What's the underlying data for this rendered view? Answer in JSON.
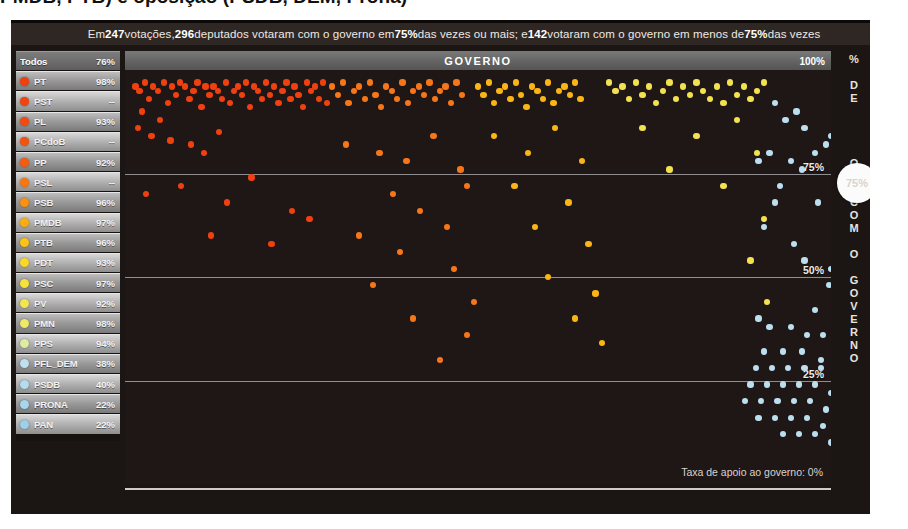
{
  "headline": "PMDB, PTB) e oposição (PSDB, DEM, Prona)",
  "banner": {
    "prefix": "Em ",
    "votacoes_count": "247",
    "mid1": " votações, ",
    "deputados_high": "296",
    "mid2": " deputados votaram com o governo em ",
    "threshold1": "75%",
    "mid3": " das vezes ou mais; e ",
    "deputados_low": "142",
    "mid4": " votaram com o governo em menos de ",
    "threshold2": "75%",
    "suffix": " das vezes"
  },
  "sidebar": {
    "rows": [
      {
        "name": "Todos",
        "pct": "76%",
        "color": "none",
        "all": true
      },
      {
        "name": "PT",
        "pct": "98%",
        "color": "#f04010"
      },
      {
        "name": "PST",
        "pct": "--",
        "color": "#f2440f"
      },
      {
        "name": "PL",
        "pct": "93%",
        "color": "#f24a10"
      },
      {
        "name": "PCdoB",
        "pct": "--",
        "color": "#f4520f"
      },
      {
        "name": "PP",
        "pct": "92%",
        "color": "#f55c10"
      },
      {
        "name": "PSL",
        "pct": "--",
        "color": "#f8760f"
      },
      {
        "name": "PSB",
        "pct": "96%",
        "color": "#fa9210"
      },
      {
        "name": "PMDB",
        "pct": "97%",
        "color": "#fcae10"
      },
      {
        "name": "PTB",
        "pct": "96%",
        "color": "#fdc414"
      },
      {
        "name": "PDT",
        "pct": "93%",
        "color": "#fad828"
      },
      {
        "name": "PSC",
        "pct": "97%",
        "color": "#f7e23a"
      },
      {
        "name": "PV",
        "pct": "92%",
        "color": "#f3e64c"
      },
      {
        "name": "PMN",
        "pct": "98%",
        "color": "#eeea66"
      },
      {
        "name": "PPS",
        "pct": "94%",
        "color": "#dfeba0"
      },
      {
        "name": "PFL_DEM",
        "pct": "38%",
        "color": "#bfe0ef"
      },
      {
        "name": "PSDB",
        "pct": "40%",
        "color": "#b4dcee"
      },
      {
        "name": "PRONA",
        "pct": "22%",
        "color": "#a8d6ec"
      },
      {
        "name": "PAN",
        "pct": "22%",
        "color": "#9ed0ea"
      }
    ]
  },
  "plot": {
    "top_bar_label": "GOVERNO",
    "top_bar_max": "100%",
    "footnote": "Taxa de apoio ao governo: 0%",
    "gridlabels": [
      "75%",
      "50%",
      "25%"
    ],
    "vertical_axis": [
      "%",
      "",
      "D",
      "E",
      "",
      "V",
      "O",
      "T",
      "O",
      "S",
      "",
      "C",
      "O",
      "M",
      "",
      "O",
      "",
      "G",
      "O",
      "V",
      "E",
      "R",
      "N",
      "O"
    ],
    "slider_handle_value": "75%"
  },
  "chart_data": {
    "type": "scatter",
    "title": "GOVERNO",
    "xlabel": "",
    "ylabel": "% DE VOTOS COM O GOVERNO",
    "ylim": [
      0,
      100
    ],
    "xlim": [
      0,
      513
    ],
    "grid": true,
    "gridlines_y": [
      75,
      50,
      25
    ],
    "legend_position": "left",
    "reference_line": 75,
    "annotations": [
      "Em 247 votações, 296 deputados votaram com o governo em 75% das vezes ou mais; e 142 votaram com o governo em menos de 75% das vezes",
      "Taxa de apoio ao governo: 0%"
    ],
    "series": [
      {
        "name": "PT",
        "color": "#f04010",
        "points": [
          [
            4,
            96
          ],
          [
            7,
            95
          ],
          [
            11,
            97
          ],
          [
            14,
            93
          ],
          [
            17,
            96
          ],
          [
            9,
            90
          ],
          [
            21,
            95
          ],
          [
            25,
            97
          ],
          [
            28,
            92
          ],
          [
            31,
            96
          ],
          [
            34,
            94
          ],
          [
            37,
            97
          ],
          [
            22,
            88
          ],
          [
            41,
            96
          ],
          [
            44,
            93
          ],
          [
            47,
            95
          ],
          [
            50,
            97
          ],
          [
            53,
            91
          ],
          [
            56,
            96
          ],
          [
            59,
            94
          ],
          [
            6,
            86
          ],
          [
            16,
            84
          ],
          [
            62,
            96
          ],
          [
            65,
            95
          ],
          [
            68,
            93
          ],
          [
            71,
            97
          ],
          [
            74,
            92
          ],
          [
            77,
            95
          ],
          [
            30,
            83
          ],
          [
            80,
            96
          ],
          [
            83,
            94
          ],
          [
            86,
            97
          ],
          [
            89,
            91
          ],
          [
            92,
            96
          ],
          [
            95,
            95
          ],
          [
            45,
            82
          ],
          [
            98,
            93
          ],
          [
            101,
            97
          ],
          [
            104,
            94
          ],
          [
            107,
            96
          ],
          [
            110,
            92
          ],
          [
            113,
            95
          ],
          [
            55,
            80
          ],
          [
            116,
            97
          ],
          [
            119,
            93
          ],
          [
            122,
            96
          ],
          [
            125,
            94
          ],
          [
            128,
            91
          ],
          [
            131,
            97
          ],
          [
            66,
            85
          ],
          [
            134,
            95
          ],
          [
            137,
            96
          ],
          [
            140,
            93
          ],
          [
            143,
            97
          ],
          [
            146,
            92
          ],
          [
            12,
            70
          ],
          [
            38,
            72
          ],
          [
            72,
            68
          ],
          [
            90,
            74
          ],
          [
            120,
            66
          ],
          [
            60,
            60
          ],
          [
            105,
            58
          ],
          [
            133,
            64
          ]
        ]
      },
      {
        "name": "PL/PP",
        "color": "#f7761a",
        "points": [
          [
            150,
            96
          ],
          [
            154,
            94
          ],
          [
            158,
            97
          ],
          [
            162,
            92
          ],
          [
            166,
            95
          ],
          [
            170,
            96
          ],
          [
            174,
            93
          ],
          [
            178,
            97
          ],
          [
            182,
            94
          ],
          [
            186,
            91
          ],
          [
            190,
            96
          ],
          [
            194,
            95
          ],
          [
            198,
            93
          ],
          [
            202,
            97
          ],
          [
            206,
            92
          ],
          [
            210,
            95
          ],
          [
            214,
            96
          ],
          [
            218,
            94
          ],
          [
            222,
            97
          ],
          [
            226,
            93
          ],
          [
            230,
            95
          ],
          [
            234,
            96
          ],
          [
            238,
            92
          ],
          [
            242,
            97
          ],
          [
            246,
            94
          ],
          [
            160,
            82
          ],
          [
            185,
            80
          ],
          [
            205,
            78
          ],
          [
            225,
            84
          ],
          [
            245,
            76
          ],
          [
            195,
            70
          ],
          [
            215,
            66
          ],
          [
            250,
            72
          ],
          [
            170,
            60
          ],
          [
            200,
            56
          ],
          [
            235,
            62
          ],
          [
            180,
            48
          ],
          [
            240,
            52
          ],
          [
            255,
            44
          ],
          [
            210,
            40
          ],
          [
            250,
            36
          ],
          [
            230,
            30
          ]
        ]
      },
      {
        "name": "PMDB/PTB",
        "color": "#fbb616",
        "points": [
          [
            258,
            96
          ],
          [
            262,
            94
          ],
          [
            266,
            97
          ],
          [
            270,
            92
          ],
          [
            274,
            95
          ],
          [
            278,
            96
          ],
          [
            282,
            93
          ],
          [
            286,
            97
          ],
          [
            290,
            94
          ],
          [
            294,
            91
          ],
          [
            298,
            96
          ],
          [
            302,
            95
          ],
          [
            306,
            93
          ],
          [
            310,
            97
          ],
          [
            314,
            92
          ],
          [
            318,
            95
          ],
          [
            322,
            96
          ],
          [
            326,
            94
          ],
          [
            330,
            97
          ],
          [
            334,
            93
          ],
          [
            270,
            84
          ],
          [
            295,
            80
          ],
          [
            315,
            86
          ],
          [
            335,
            78
          ],
          [
            285,
            72
          ],
          [
            325,
            68
          ],
          [
            300,
            62
          ],
          [
            340,
            58
          ],
          [
            310,
            50
          ],
          [
            345,
            46
          ],
          [
            330,
            40
          ],
          [
            350,
            34
          ]
        ]
      },
      {
        "name": "PSC/PV/PMN",
        "color": "#f2e250",
        "points": [
          [
            355,
            97
          ],
          [
            360,
            95
          ],
          [
            365,
            96
          ],
          [
            370,
            93
          ],
          [
            375,
            97
          ],
          [
            380,
            94
          ],
          [
            385,
            96
          ],
          [
            390,
            92
          ],
          [
            395,
            95
          ],
          [
            400,
            97
          ],
          [
            405,
            93
          ],
          [
            410,
            96
          ],
          [
            415,
            94
          ],
          [
            420,
            97
          ],
          [
            425,
            95
          ],
          [
            430,
            93
          ],
          [
            435,
            96
          ],
          [
            440,
            92
          ],
          [
            445,
            97
          ],
          [
            450,
            94
          ],
          [
            455,
            96
          ],
          [
            460,
            93
          ],
          [
            465,
            95
          ],
          [
            470,
            97
          ],
          [
            380,
            86
          ],
          [
            420,
            84
          ],
          [
            450,
            88
          ],
          [
            400,
            76
          ],
          [
            440,
            72
          ],
          [
            465,
            80
          ],
          [
            470,
            64
          ],
          [
            460,
            54
          ],
          [
            472,
            44
          ]
        ]
      },
      {
        "name": "PFL_DEM/PSDB/PRONA/PAN",
        "color": "#bcdff0",
        "points": [
          [
            478,
            92
          ],
          [
            486,
            88
          ],
          [
            494,
            90
          ],
          [
            500,
            86
          ],
          [
            474,
            80
          ],
          [
            508,
            80
          ],
          [
            516,
            82
          ],
          [
            520,
            84
          ],
          [
            490,
            78
          ],
          [
            466,
            78
          ],
          [
            498,
            76
          ],
          [
            482,
            72
          ],
          [
            478,
            68
          ],
          [
            510,
            68
          ],
          [
            470,
            62
          ],
          [
            492,
            58
          ],
          [
            500,
            54
          ],
          [
            520,
            52
          ],
          [
            530,
            50
          ],
          [
            518,
            48
          ],
          [
            526,
            46
          ],
          [
            534,
            44
          ],
          [
            508,
            42
          ],
          [
            540,
            40
          ],
          [
            466,
            40
          ],
          [
            474,
            38
          ],
          [
            490,
            38
          ],
          [
            502,
            36
          ],
          [
            514,
            36
          ],
          [
            530,
            34
          ],
          [
            544,
            34
          ],
          [
            470,
            32
          ],
          [
            484,
            32
          ],
          [
            498,
            32
          ],
          [
            512,
            30
          ],
          [
            526,
            30
          ],
          [
            538,
            30
          ],
          [
            550,
            32
          ],
          [
            464,
            28
          ],
          [
            476,
            28
          ],
          [
            488,
            28
          ],
          [
            500,
            28
          ],
          [
            512,
            28
          ],
          [
            524,
            26
          ],
          [
            536,
            26
          ],
          [
            548,
            26
          ],
          [
            460,
            24
          ],
          [
            472,
            24
          ],
          [
            484,
            24
          ],
          [
            496,
            24
          ],
          [
            508,
            24
          ],
          [
            520,
            22
          ],
          [
            532,
            22
          ],
          [
            544,
            22
          ],
          [
            556,
            24
          ],
          [
            456,
            20
          ],
          [
            468,
            20
          ],
          [
            480,
            20
          ],
          [
            492,
            20
          ],
          [
            504,
            20
          ],
          [
            516,
            18
          ],
          [
            528,
            18
          ],
          [
            540,
            18
          ],
          [
            552,
            20
          ],
          [
            466,
            16
          ],
          [
            478,
            16
          ],
          [
            490,
            16
          ],
          [
            502,
            16
          ],
          [
            514,
            14
          ],
          [
            526,
            14
          ],
          [
            538,
            14
          ],
          [
            550,
            16
          ],
          [
            484,
            12
          ],
          [
            496,
            12
          ],
          [
            508,
            12
          ],
          [
            520,
            10
          ],
          [
            534,
            12
          ],
          [
            546,
            14
          ],
          [
            554,
            8
          ],
          [
            556,
            6
          ],
          [
            544,
            4
          ]
        ]
      }
    ]
  }
}
